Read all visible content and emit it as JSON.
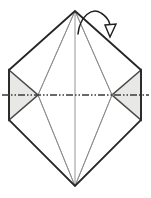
{
  "canvas": {
    "width": 151,
    "height": 198,
    "background": "#ffffff"
  },
  "diagram": {
    "type": "origami-fold-instruction",
    "colors": {
      "outline": "#262626",
      "crease_thin": "#8a8a8a",
      "shade_fill": "#e8e8e6",
      "shade_stroke": "#4a4a4a",
      "centerline": "#3a3a3a",
      "arrow": "#1f1f1f",
      "background": "#ffffff"
    },
    "shapes": {
      "outer_hexagon": {
        "name": "outer-hexagon",
        "points": "75,11 141,70 141,120 75,186 9,120 9,70"
      },
      "inner_diamond": {
        "name": "inner-diamond",
        "points": "75,11 112,95 75,186 38,95"
      },
      "left_flap": {
        "name": "left-shaded-flap",
        "points": "9,70 38,95 9,120"
      },
      "right_flap": {
        "name": "right-shaded-flap",
        "points": "141,70 112,95 141,120"
      },
      "creases": [
        {
          "name": "crease-top-to-left-node",
          "x1": 75,
          "y1": 11,
          "x2": 38,
          "y2": 95
        },
        {
          "name": "crease-top-to-right-node",
          "x1": 75,
          "y1": 11,
          "x2": 112,
          "y2": 95
        },
        {
          "name": "crease-bottom-to-left-node",
          "x1": 75,
          "y1": 186,
          "x2": 38,
          "y2": 95
        },
        {
          "name": "crease-bottom-to-right-node",
          "x1": 75,
          "y1": 186,
          "x2": 112,
          "y2": 95
        },
        {
          "name": "crease-vertical-axis",
          "x1": 75,
          "y1": 11,
          "x2": 75,
          "y2": 186
        }
      ],
      "centerline": {
        "name": "horizontal-chain-centerline",
        "x1": 2,
        "y1": 95,
        "x2": 149,
        "y2": 95,
        "dash_pattern": "7,2,1.5,2,1.5,2"
      },
      "fold_arrow": {
        "name": "fold-direction-arrow",
        "path": "M 78 34 C 80 16 92 7 101 13 C 109 18 111 25 110 29",
        "head": "105,26 116,25 110,37"
      }
    }
  }
}
